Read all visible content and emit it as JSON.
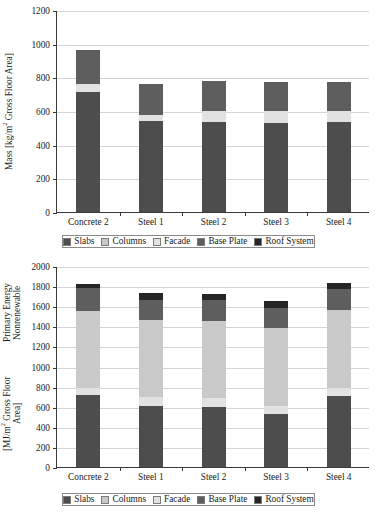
{
  "legend": {
    "items": [
      {
        "label": "Slabs",
        "color": "#4d4d4d"
      },
      {
        "label": "Columns",
        "color": "#c9c9c9"
      },
      {
        "label": "Facade",
        "color": "#e2e2e2"
      },
      {
        "label": "Base Plate",
        "color": "#5e5e5e"
      },
      {
        "label": "Roof System",
        "color": "#262626"
      }
    ]
  },
  "chart_data": [
    {
      "type": "bar",
      "stacked": true,
      "id": "mass",
      "title": "",
      "xlabel": "",
      "ylabel": "Mass [kg/m2 Gross Floor Area]",
      "ylabel_prefix": "Mass [kg/m",
      "ylabel_sup": "2",
      "ylabel_suffix": " Gross Floor Area]",
      "categories": [
        "Concrete 2",
        "Steel 1",
        "Steel 2",
        "Steel 3",
        "Steel 4"
      ],
      "ylim": [
        0,
        1200
      ],
      "yticks": [
        0,
        200,
        400,
        600,
        800,
        1000,
        1200
      ],
      "grid": true,
      "legend_position": "bottom",
      "series": [
        {
          "name": "Slabs",
          "color": "#4d4d4d",
          "values": [
            710,
            540,
            537,
            528,
            535
          ]
        },
        {
          "name": "Columns",
          "color": "#c9c9c9",
          "values": [
            0,
            0,
            0,
            0,
            0
          ]
        },
        {
          "name": "Facade",
          "color": "#e2e2e2",
          "values": [
            50,
            38,
            65,
            72,
            65
          ]
        },
        {
          "name": "Base Plate",
          "color": "#5e5e5e",
          "values": [
            200,
            182,
            178,
            170,
            175
          ]
        },
        {
          "name": "Roof System",
          "color": "#262626",
          "values": [
            0,
            0,
            0,
            0,
            0
          ]
        }
      ],
      "totals": [
        960,
        760,
        780,
        770,
        775
      ]
    },
    {
      "type": "bar",
      "stacked": true,
      "id": "energy",
      "title": "",
      "xlabel": "",
      "ylabel": "Primary Energy Nonrenewable [MJ/m2 Gross Floor Area]",
      "ylabel_line1": "Primary Energy Nonrenewable",
      "ylabel_line2_prefix": "[MJ/m",
      "ylabel_line2_sup": "2",
      "ylabel_line2_suffix": " Gross Floor Area]",
      "categories": [
        "Concrete 2",
        "Steel 1",
        "Steel 2",
        "Steel 3",
        "Steel 4"
      ],
      "ylim": [
        0,
        2000
      ],
      "yticks": [
        0,
        200,
        400,
        600,
        800,
        1000,
        1200,
        1400,
        1600,
        1800,
        2000
      ],
      "grid": true,
      "legend_position": "bottom",
      "series": [
        {
          "name": "Slabs",
          "color": "#4d4d4d",
          "values": [
            715,
            605,
            602,
            525,
            708
          ]
        },
        {
          "name": "Facade",
          "color": "#e2e2e2",
          "values": [
            75,
            90,
            80,
            80,
            80
          ]
        },
        {
          "name": "Columns",
          "color": "#c9c9c9",
          "values": [
            760,
            765,
            770,
            775,
            770
          ]
        },
        {
          "name": "Base Plate",
          "color": "#5e5e5e",
          "values": [
            230,
            200,
            205,
            200,
            215
          ]
        },
        {
          "name": "Roof System",
          "color": "#262626",
          "values": [
            45,
            75,
            65,
            70,
            62
          ]
        }
      ],
      "totals": [
        1825,
        1735,
        1722,
        1650,
        1835
      ]
    }
  ]
}
